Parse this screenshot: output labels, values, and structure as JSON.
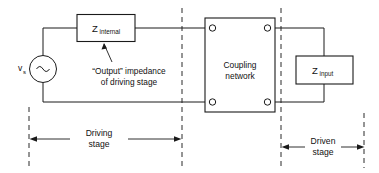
{
  "diagram": {
    "source": {
      "name": "voltage-source",
      "label": "v",
      "subscript": "s",
      "symbol": "sine-wave"
    },
    "blocks": [
      {
        "id": "z-internal",
        "label": "Z",
        "subscript": "internal"
      },
      {
        "id": "coupling-network",
        "label_line1": "Coupling",
        "label_line2": "network"
      },
      {
        "id": "z-input",
        "label": "Z",
        "subscript": "input"
      }
    ],
    "annotations": [
      {
        "id": "output-impedance-note",
        "line1": "“Output” impedance",
        "line2": "of driving stage"
      }
    ],
    "dimensions": [
      {
        "id": "driving-stage",
        "line1": "Driving",
        "line2": "stage"
      },
      {
        "id": "driven-stage",
        "line1": "Driven",
        "line2": "stage"
      }
    ],
    "colors": {
      "line": "#1a1a1a",
      "text": "#111111",
      "background": "#ffffff",
      "dashed": "#2b2b2b"
    }
  }
}
